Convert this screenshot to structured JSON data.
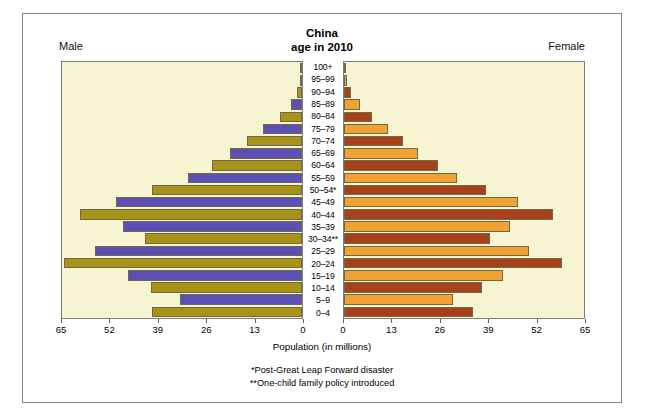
{
  "figure": {
    "title_line1": "China",
    "title_line2": "age in 2010",
    "male_label": "Male",
    "female_label": "Female",
    "axis_caption": "Population (in millions)",
    "footnote1": "*Post-Great Leap Forward disaster",
    "footnote2": "**One-child family policy introduced"
  },
  "colors": {
    "male_a": "#5d4fb4",
    "male_b": "#a89218",
    "female_a": "#a8411b",
    "female_b": "#f2a233",
    "panel_bg": "#f7f4d2",
    "frame": "#8a8a8a"
  },
  "chart_data": {
    "type": "bar",
    "title": "China age in 2010",
    "subtype": "population-pyramid",
    "xlabel": "Population (in millions)",
    "ylabel": "",
    "xlim_male": [
      65,
      0
    ],
    "xlim_female": [
      0,
      65
    ],
    "grid": false,
    "legend_position": "none",
    "ticks_male": [
      65,
      52,
      39,
      26,
      13,
      0
    ],
    "ticks_female": [
      0,
      13,
      26,
      39,
      52,
      65
    ],
    "categories": [
      "100+",
      "95–99",
      "90–94",
      "85–89",
      "80–84",
      "75–79",
      "70–74",
      "65–69",
      "60–64",
      "55–59",
      "50–54*",
      "45–49",
      "40–44",
      "35–39",
      "30–34**",
      "25–29",
      "20–24",
      "15–19",
      "10–14",
      "5–9",
      "0–4"
    ],
    "series": [
      {
        "name": "Male",
        "side": "left",
        "values": [
          0.1,
          0.5,
          1.3,
          3.0,
          6.0,
          10.5,
          15.0,
          19.5,
          24.5,
          31.0,
          40.5,
          50.5,
          60.0,
          48.5,
          42.5,
          56.0,
          64.5,
          47.0,
          41.0,
          33.0,
          40.5
        ]
      },
      {
        "name": "Female",
        "side": "right",
        "values": [
          0.2,
          0.8,
          2.0,
          4.2,
          7.5,
          12.0,
          16.0,
          20.0,
          25.5,
          30.5,
          38.5,
          47.0,
          56.5,
          45.0,
          39.5,
          50.0,
          59.0,
          43.0,
          37.5,
          29.5,
          35.0
        ]
      }
    ]
  }
}
